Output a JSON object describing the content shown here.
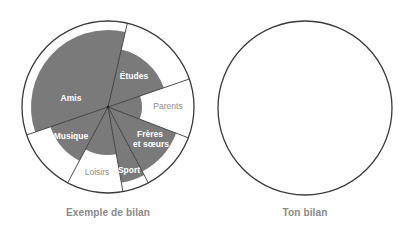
{
  "chart_data": {
    "type": "radial-sector (wheel of life)",
    "title": "",
    "charts": [
      {
        "caption": "Exemple de bilan",
        "center": [
          108,
          107
        ],
        "outer_radius": 86,
        "fill_color": "#7a7a7a",
        "label_color_on_fill": "#ffffff",
        "label_color_on_white": "#8a8a8a",
        "sectors": [
          {
            "label": "Amis",
            "start_deg": -109,
            "end_deg": 13,
            "value_radius": 77,
            "label_pos": [
              71,
              101
            ],
            "label_on_fill": true
          },
          {
            "label": "Études",
            "start_deg": 13,
            "end_deg": 71,
            "value_radius": 59,
            "label_pos": [
              134,
              79
            ],
            "label_on_fill": true
          },
          {
            "label": "Parents",
            "start_deg": 71,
            "end_deg": 111,
            "value_radius": 34,
            "label_pos": [
              168,
              109
            ],
            "label_on_fill": false
          },
          {
            "label": "Frères et sœurs",
            "label_lines": [
              "Frères",
              "et sœurs"
            ],
            "start_deg": 111,
            "end_deg": 152,
            "value_radius": 73,
            "label_pos": [
              150,
              137
            ],
            "label_on_fill": true
          },
          {
            "label": "Sport",
            "start_deg": 152,
            "end_deg": 170,
            "value_radius": 77,
            "label_pos": [
              129,
              173
            ],
            "label_on_fill": true
          },
          {
            "label": "Loisirs",
            "start_deg": 170,
            "end_deg": 208,
            "value_radius": 48,
            "label_pos": [
              97,
              175
            ],
            "label_on_fill": false
          },
          {
            "label": "Musique",
            "start_deg": 208,
            "end_deg": 251,
            "value_radius": 61,
            "label_pos": [
              71,
              139
            ],
            "label_on_fill": true
          }
        ]
      },
      {
        "caption": "Ton bilan",
        "center": [
          305,
          108
        ],
        "outer_radius": 87,
        "sectors": []
      }
    ]
  },
  "labels": {
    "amis": "Amis",
    "etudes": "Études",
    "parents": "Parents",
    "freres_line1": "Frères",
    "freres_line2": "et sœurs",
    "sport": "Sport",
    "loisirs": "Loisirs",
    "musique": "Musique"
  },
  "captions": {
    "example": "Exemple de bilan",
    "yours": "Ton bilan"
  },
  "colors": {
    "fill": "#7a7a7a",
    "stroke": "#3a3a3a",
    "caption": "#8a8a8a"
  }
}
